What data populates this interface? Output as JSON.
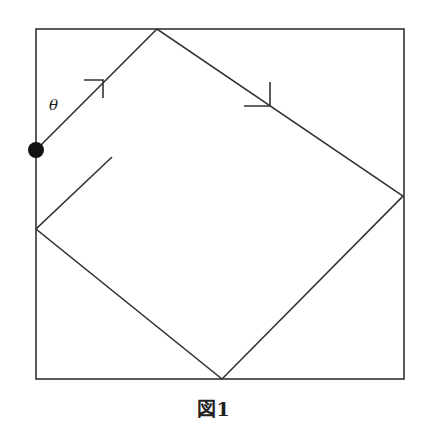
{
  "diagram": {
    "angle_label": "θ",
    "caption": "図1",
    "line_color": "#333333",
    "box": {
      "x": 36,
      "y": 29,
      "width": 368,
      "height": 350
    },
    "ball": {
      "cx": 36,
      "cy": 150,
      "r": 8
    },
    "path_points": [
      [
        36,
        150
      ],
      [
        157,
        29
      ],
      [
        403,
        196
      ],
      [
        222,
        379
      ],
      [
        36,
        229
      ],
      [
        112,
        157
      ]
    ],
    "arrows": [
      {
        "vertex": [
          103,
          80
        ],
        "arm1": [
          84,
          80
        ],
        "arm2": [
          103,
          98
        ]
      },
      {
        "vertex": [
          270,
          106
        ],
        "arm1": [
          270,
          82
        ],
        "arm2": [
          244,
          106
        ]
      }
    ]
  }
}
